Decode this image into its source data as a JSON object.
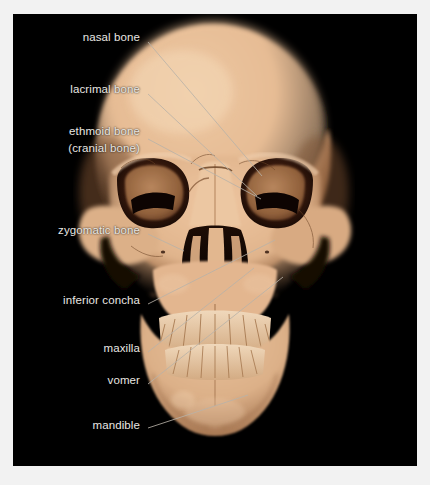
{
  "figure": {
    "background_color": "#000000",
    "page_color": "#ffffff",
    "label_color": "#e8e6e2",
    "leader_color": "#b9b2a8",
    "bone_color": "#e3b68f",
    "bone_shadow_color": "#8d5f3c",
    "cavity_color": "#120703"
  },
  "labels": [
    {
      "id": "nasal-bone",
      "text": "nasal bone",
      "x": 140,
      "y": 36,
      "align": "right"
    },
    {
      "id": "lacrimal-bone",
      "text": "lacrimal bone",
      "x": 140,
      "y": 88,
      "align": "right"
    },
    {
      "id": "ethmoid-bone",
      "text": "ethmoid bone",
      "x": 140,
      "y": 130,
      "align": "right"
    },
    {
      "id": "cranial-bone",
      "text": "(cranial bone)",
      "x": 140,
      "y": 147,
      "align": "right"
    },
    {
      "id": "zygomatic-bone",
      "text": "zygomatic bone",
      "x": 140,
      "y": 229,
      "align": "right"
    },
    {
      "id": "inferior-concha",
      "text": "inferior concha",
      "x": 140,
      "y": 299,
      "align": "right"
    },
    {
      "id": "maxilla",
      "text": "maxilla",
      "x": 140,
      "y": 347,
      "align": "right"
    },
    {
      "id": "vomer",
      "text": "vomer",
      "x": 140,
      "y": 379,
      "align": "right"
    },
    {
      "id": "mandible",
      "text": "mandible",
      "x": 140,
      "y": 424,
      "align": "right"
    }
  ],
  "leaders": [
    {
      "id": "leader-nasal-bone",
      "x1": 148,
      "y1": 42,
      "x2": 262,
      "y2": 176
    },
    {
      "id": "leader-lacrimal-bone",
      "x1": 148,
      "y1": 94,
      "x2": 257,
      "y2": 196
    },
    {
      "id": "leader-ethmoid-bone",
      "x1": 148,
      "y1": 139,
      "x2": 261,
      "y2": 199
    },
    {
      "id": "leader-zygomatic-bone",
      "x1": 148,
      "y1": 234,
      "x2": 184,
      "y2": 251
    },
    {
      "id": "leader-inferior-concha",
      "x1": 148,
      "y1": 304,
      "x2": 275,
      "y2": 240
    },
    {
      "id": "leader-maxilla",
      "x1": 148,
      "y1": 352,
      "x2": 254,
      "y2": 268
    },
    {
      "id": "leader-vomer",
      "x1": 148,
      "y1": 384,
      "x2": 283,
      "y2": 277
    },
    {
      "id": "leader-mandible",
      "x1": 148,
      "y1": 428,
      "x2": 248,
      "y2": 395
    }
  ]
}
